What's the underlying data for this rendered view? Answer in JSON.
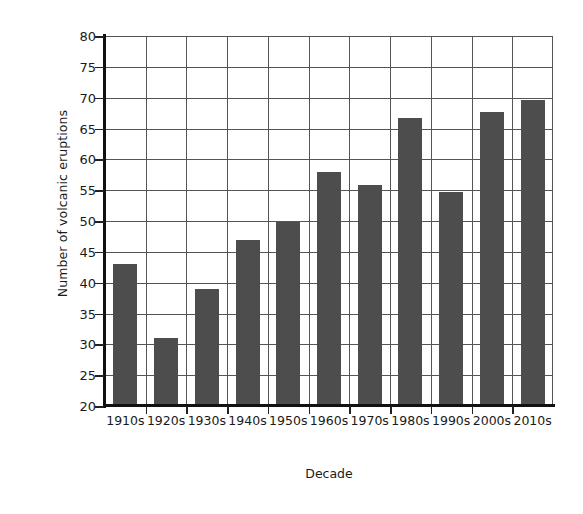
{
  "chart_data": {
    "type": "bar",
    "title": "",
    "xlabel": "Decade",
    "ylabel": "Number of volcanic eruptions",
    "categories": [
      "1910s",
      "1920s",
      "1930s",
      "1940s",
      "1950s",
      "1960s",
      "1970s",
      "1980s",
      "1990s",
      "2000s",
      "2010s"
    ],
    "values": [
      43,
      31,
      39,
      47,
      49.8,
      58,
      55.8,
      66.7,
      54.7,
      67.7,
      69.7
    ],
    "ylim": [
      20,
      80
    ],
    "yticks": [
      20,
      25,
      30,
      35,
      40,
      45,
      50,
      55,
      60,
      65,
      70,
      75,
      80
    ],
    "ytick_labels": [
      "20",
      "25",
      "30",
      "35",
      "40",
      "45",
      "50",
      "55",
      "60",
      "65",
      "70",
      "75",
      "80"
    ],
    "grid": "both",
    "legend": "none",
    "bar_color": "#4d4d4d",
    "grid_color": "#555555",
    "axis_color": "#111111",
    "background": "#ffffff"
  }
}
